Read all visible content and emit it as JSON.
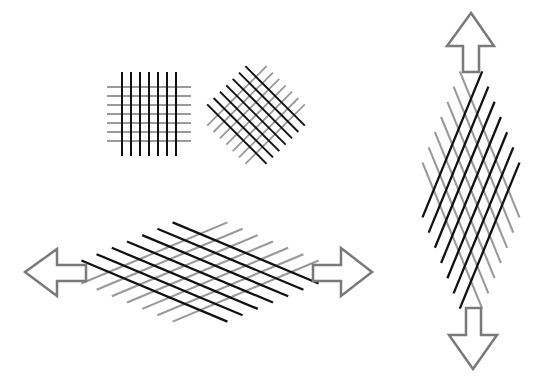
{
  "caption": "",
  "figure": {
    "colors": {
      "dark_line": "#111111",
      "light_line": "#9a9a9a",
      "arrow_stroke": "#7a7a7a",
      "arrow_fill": "#ffffff",
      "background": "#ffffff"
    },
    "panels": [
      {
        "id": "square-grid",
        "label": "original grid",
        "rotation_deg": 0,
        "stretch": "none",
        "line_count_each_direction": 7
      },
      {
        "id": "rotated-grid",
        "label": "rotated grid",
        "rotation_deg": 45,
        "stretch": "none",
        "line_count_each_direction": 7
      },
      {
        "id": "horizontal-stretch",
        "label": "stretched horizontally",
        "rotation_deg": 45,
        "stretch": "horizontal",
        "arrows": [
          "left",
          "right"
        ],
        "line_count_each_direction": 7
      },
      {
        "id": "vertical-stretch",
        "label": "stretched vertically",
        "rotation_deg": 45,
        "stretch": "vertical",
        "arrows": [
          "up",
          "down"
        ],
        "line_count_each_direction": 7
      }
    ]
  }
}
